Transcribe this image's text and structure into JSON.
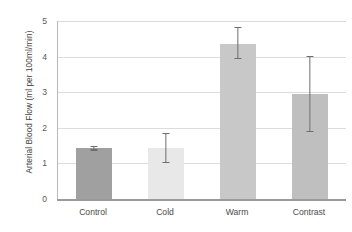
{
  "chart_data": {
    "type": "bar",
    "title": "",
    "xlabel": "",
    "ylabel": "Arterial Blood Flow (ml per 100ml/min)",
    "categories": [
      "Control",
      "Cold",
      "Warm",
      "Contrast"
    ],
    "values": [
      1.43,
      1.42,
      4.36,
      2.95
    ],
    "errors_low": [
      1.36,
      1.0,
      3.93,
      1.88
    ],
    "errors_high": [
      1.5,
      1.85,
      4.83,
      4.02
    ],
    "bar_colors": [
      "#a0a0a0",
      "#e8e8e8",
      "#c8c8c8",
      "#bfbfbf"
    ],
    "error_bar_color": "#6e6e6e",
    "ylim": [
      0,
      5
    ],
    "yticks": [
      0,
      1,
      2,
      3,
      4,
      5
    ],
    "ytick_labels": [
      "0",
      "1",
      "2",
      "3",
      "4",
      "5"
    ],
    "grid": true,
    "grid_axis": "y",
    "grid_color": "#dcdcdc",
    "legend": false,
    "legend_position": "none",
    "background_color": "#ffffff",
    "axis_color": "#9e9e9e"
  }
}
